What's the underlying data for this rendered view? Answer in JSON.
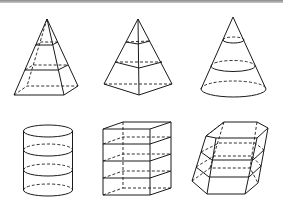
{
  "figure": {
    "layout": {
      "rows": 2,
      "cols": 3
    },
    "shapes": [
      {
        "id": "square-pyramid",
        "label": "",
        "sections": 2
      },
      {
        "id": "quadrilateral-pyramid",
        "label": "",
        "sections": 2
      },
      {
        "id": "cone",
        "label": "",
        "sections": 2
      },
      {
        "id": "cylinder",
        "label": "",
        "sections": 2
      },
      {
        "id": "rectangular-prism",
        "label": "",
        "sections": 3
      },
      {
        "id": "oblique-hexagonal-prism",
        "label": "",
        "sections": 2
      }
    ],
    "colors": {
      "stroke": "#1a1a1a",
      "background": "#ffffff"
    }
  }
}
